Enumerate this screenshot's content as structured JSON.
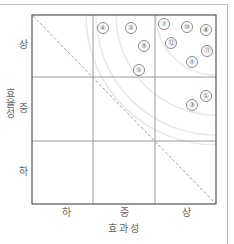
{
  "chart_data": {
    "type": "scatter",
    "title": "",
    "xlabel": "효과성",
    "ylabel": "효율성",
    "x_ticks": [
      "하",
      "중",
      "상"
    ],
    "y_ticks": [
      "상",
      "중",
      "하"
    ],
    "grid": "3x3",
    "diagonal": "dashed line from top-left to bottom-right",
    "arcs": "faint concentric arcs centered at top-right corner",
    "xlim": [
      0,
      3
    ],
    "ylim": [
      0,
      3
    ],
    "points": [
      {
        "label": "①",
        "x": 2.9,
        "y": 1.6
      },
      {
        "label": "②",
        "x": 1.6,
        "y": 2.8
      },
      {
        "label": "③",
        "x": 2.6,
        "y": 1.5
      },
      {
        "label": "④",
        "x": 2.6,
        "y": 2.3
      },
      {
        "label": "⑤",
        "x": 1.7,
        "y": 2.1
      },
      {
        "label": "⑥",
        "x": 1.2,
        "y": 2.8
      },
      {
        "label": "⑦",
        "x": 2.1,
        "y": 2.85
      },
      {
        "label": "⑧",
        "x": 2.8,
        "y": 2.8
      },
      {
        "label": "⑨",
        "x": 1.8,
        "y": 2.5
      },
      {
        "label": "⑩",
        "x": 2.5,
        "y": 2.8
      },
      {
        "label": "⑪",
        "x": 2.9,
        "y": 2.55
      },
      {
        "label": "⑫",
        "x": 2.3,
        "y": 2.55
      }
    ]
  },
  "axes": {
    "xlabel": "효과성",
    "ylabel_chars": [
      "효",
      "율",
      "성"
    ],
    "x_ticks": [
      "하",
      "중",
      "상"
    ],
    "y_ticks": [
      "상",
      "중",
      "하"
    ]
  },
  "points": [
    {
      "label": "⑥",
      "left": 103,
      "top": 28
    },
    {
      "label": "②",
      "left": 131,
      "top": 28
    },
    {
      "label": "⑨",
      "left": 144,
      "top": 46
    },
    {
      "label": "⑤",
      "left": 139,
      "top": 70
    },
    {
      "label": "⑦",
      "left": 164,
      "top": 24
    },
    {
      "label": "⑩",
      "left": 187,
      "top": 27
    },
    {
      "label": "⑧",
      "left": 206,
      "top": 30
    },
    {
      "label": "⑫",
      "left": 171,
      "top": 43
    },
    {
      "label": "⑪",
      "left": 207,
      "top": 51
    },
    {
      "label": "④",
      "left": 192,
      "top": 62
    },
    {
      "label": "①",
      "left": 206,
      "top": 96
    },
    {
      "label": "③",
      "left": 192,
      "top": 105
    }
  ],
  "colors": {
    "grid": "#8a8a8a",
    "frame": "#444444",
    "diagonal": "#9a9a9a",
    "arc": "#e6e6e6"
  }
}
